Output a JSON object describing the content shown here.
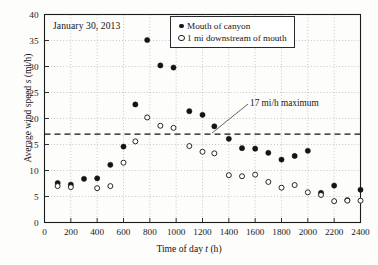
{
  "chart_data": {
    "type": "scatter",
    "title": "",
    "annotations": [
      {
        "text": "January 30, 2013",
        "name": "date-annotation"
      },
      {
        "text": "17 mi/h maximum",
        "name": "threshold-annotation",
        "value": 17
      }
    ],
    "xlabel_parts": {
      "pre": "Time of day ",
      "symbol": "t",
      "post": " (h)"
    },
    "ylabel_parts": {
      "pre": "Average wind speed ",
      "symbol": "s",
      "post": " (mi/h)"
    },
    "xlabel": "Time of day t (h)",
    "ylabel": "Average wind speed s (mi/h)",
    "xlim": [
      0,
      2400
    ],
    "ylim": [
      0,
      40
    ],
    "xticks": [
      0,
      200,
      400,
      600,
      800,
      1000,
      1200,
      1400,
      1600,
      1800,
      2000,
      2200,
      2400
    ],
    "yticks": [
      0,
      5,
      10,
      15,
      20,
      25,
      30,
      35,
      40
    ],
    "grid": true,
    "legend_position": "top-right",
    "threshold": {
      "value": 17,
      "label": "17 mi/h maximum",
      "style": "dashed"
    },
    "series": [
      {
        "name": "Mouth of canyon",
        "marker": "filled-circle",
        "color": "#141414",
        "points": [
          {
            "x": 100,
            "y": 7.6
          },
          {
            "x": 200,
            "y": 7.3
          },
          {
            "x": 300,
            "y": 8.4
          },
          {
            "x": 400,
            "y": 8.5
          },
          {
            "x": 500,
            "y": 11.1
          },
          {
            "x": 600,
            "y": 14.6
          },
          {
            "x": 690,
            "y": 22.7
          },
          {
            "x": 780,
            "y": 35.1
          },
          {
            "x": 880,
            "y": 30.2
          },
          {
            "x": 980,
            "y": 29.8
          },
          {
            "x": 1100,
            "y": 21.4
          },
          {
            "x": 1200,
            "y": 20.7
          },
          {
            "x": 1290,
            "y": 18.5
          },
          {
            "x": 1400,
            "y": 16.1
          },
          {
            "x": 1500,
            "y": 14.3
          },
          {
            "x": 1600,
            "y": 14.2
          },
          {
            "x": 1700,
            "y": 13.4
          },
          {
            "x": 1800,
            "y": 12.1
          },
          {
            "x": 1900,
            "y": 12.8
          },
          {
            "x": 2000,
            "y": 13.8
          },
          {
            "x": 2100,
            "y": 5.7
          },
          {
            "x": 2200,
            "y": 7.1
          },
          {
            "x": 2300,
            "y": 4.3
          },
          {
            "x": 2400,
            "y": 6.3
          }
        ]
      },
      {
        "name": "1 mi downstream of mouth",
        "marker": "open-circle",
        "color": "#1d1d1d",
        "points": [
          {
            "x": 100,
            "y": 7.0
          },
          {
            "x": 200,
            "y": 6.8
          },
          {
            "x": 400,
            "y": 6.6
          },
          {
            "x": 500,
            "y": 7.0
          },
          {
            "x": 600,
            "y": 11.5
          },
          {
            "x": 690,
            "y": 15.6
          },
          {
            "x": 780,
            "y": 20.2
          },
          {
            "x": 880,
            "y": 18.6
          },
          {
            "x": 980,
            "y": 18.2
          },
          {
            "x": 1100,
            "y": 14.7
          },
          {
            "x": 1200,
            "y": 13.6
          },
          {
            "x": 1290,
            "y": 13.3
          },
          {
            "x": 1400,
            "y": 9.1
          },
          {
            "x": 1500,
            "y": 8.9
          },
          {
            "x": 1600,
            "y": 9.2
          },
          {
            "x": 1700,
            "y": 7.8
          },
          {
            "x": 1800,
            "y": 6.7
          },
          {
            "x": 1900,
            "y": 7.2
          },
          {
            "x": 2000,
            "y": 5.8
          },
          {
            "x": 2100,
            "y": 5.3
          },
          {
            "x": 2200,
            "y": 4.1
          },
          {
            "x": 2300,
            "y": 4.2
          },
          {
            "x": 2400,
            "y": 4.2
          }
        ]
      }
    ]
  },
  "legend": {
    "items": [
      {
        "label": "Mouth of canyon",
        "marker": "filled-circle"
      },
      {
        "label": "1 mi downstream of mouth",
        "marker": "open-circle"
      }
    ]
  },
  "labels": {
    "date": "January 30, 2013",
    "threshold": "17 mi/h maximum",
    "xaxis_pre": "Time of day ",
    "xaxis_symbol": "t",
    "xaxis_post": " (h)",
    "yaxis_pre": "Average wind speed ",
    "yaxis_symbol": "s",
    "yaxis_post": " (mi/h)"
  },
  "colors": {
    "series_filled": "#141414",
    "series_open": "#1d1d1d",
    "axis": "#1b1b1b",
    "grid": "#9a9a9a",
    "background": "#fdfdfc"
  }
}
